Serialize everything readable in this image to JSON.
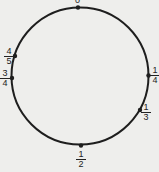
{
  "diagram": {
    "type": "circle-fraction-markers",
    "colors": {
      "stroke": "#1e1e1e",
      "background": "#eeeeec"
    },
    "points": [
      {
        "label": "0"
      },
      {
        "numerator": "1",
        "denominator": "4"
      },
      {
        "numerator": "1",
        "denominator": "3"
      },
      {
        "numerator": "1",
        "denominator": "2"
      },
      {
        "numerator": "3",
        "denominator": "4"
      },
      {
        "numerator": "4",
        "denominator": "5"
      }
    ]
  }
}
